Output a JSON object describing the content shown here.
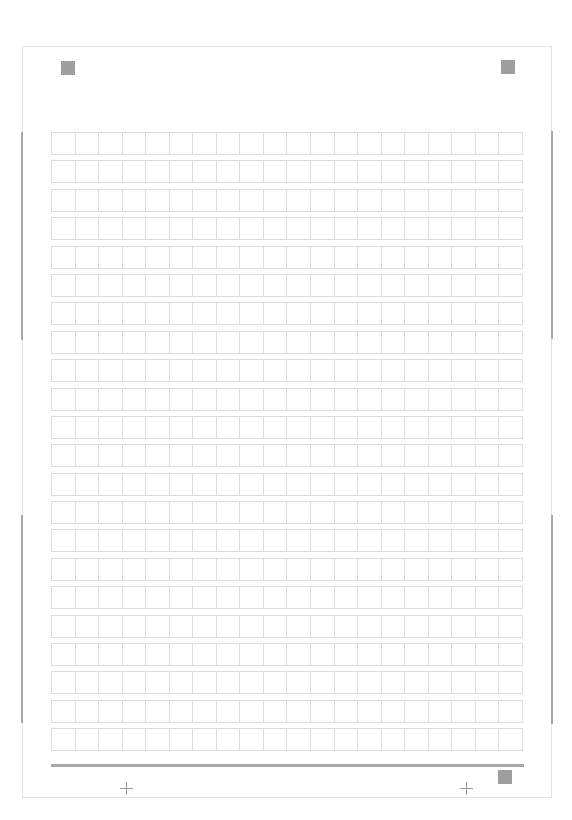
{
  "document": {
    "type": "genko-yoshi manuscript sheet",
    "grid": {
      "columns": 20,
      "rows": 22
    },
    "colors": {
      "grid_line": "#dcdcdc",
      "border": "#e2e2e2",
      "marker": "#9e9e9e",
      "rule": "#a8a8a8"
    }
  }
}
